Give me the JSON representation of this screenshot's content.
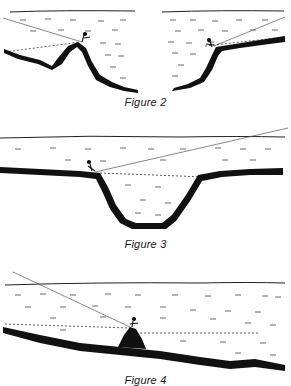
{
  "figures": [
    {
      "id": "figure-2",
      "caption": "Figure 2",
      "description": "Two cross-sections: an angler standing on an underwater hump (left) and on a drop-off ledge (right), casting into deeper water"
    },
    {
      "id": "figure-3",
      "caption": "Figure 3",
      "description": "Angler standing at the edge of a flat shore beside a deep trough/channel, line cast across it"
    },
    {
      "id": "figure-4",
      "caption": "Figure 4",
      "description": "Angler on a rock pile on a gently sloping bottom, casting line upward"
    }
  ],
  "colors": {
    "ink": "#111111",
    "paper": "#ffffff",
    "line": "#555555"
  }
}
